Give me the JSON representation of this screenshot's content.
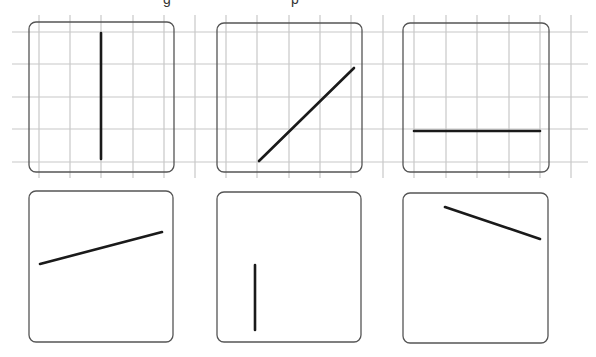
{
  "colors": {
    "background": "#ffffff",
    "grid": "#c8c8c8",
    "frame": "#555555",
    "segment": "#1a1a1a"
  },
  "grid": {
    "h_lines_y": [
      32,
      64,
      97,
      129,
      162
    ],
    "h_line_spans": [
      [
        12,
        200
      ],
      [
        200,
        386
      ],
      [
        386,
        588
      ]
    ],
    "v_lines_x": [
      39,
      70,
      101,
      133,
      164,
      195,
      226,
      257,
      289,
      320,
      351,
      383,
      414,
      446,
      477,
      509,
      540,
      571
    ],
    "v_line_range": [
      15,
      178
    ]
  },
  "panels": [
    {
      "id": "top-1",
      "row": "top",
      "x": 29,
      "y": 22,
      "w": 145,
      "h": 150,
      "gridded": true,
      "segment": {
        "x1": 101,
        "y1": 33,
        "x2": 101,
        "y2": 159,
        "orientation": "vertical"
      }
    },
    {
      "id": "top-2",
      "row": "top",
      "x": 217,
      "y": 23,
      "w": 145,
      "h": 149,
      "gridded": true,
      "segment": {
        "x1": 259,
        "y1": 161,
        "x2": 354,
        "y2": 68,
        "orientation": "diagonal-up"
      }
    },
    {
      "id": "top-3",
      "row": "top",
      "x": 403,
      "y": 23,
      "w": 146,
      "h": 149,
      "gridded": true,
      "segment": {
        "x1": 414,
        "y1": 131,
        "x2": 540,
        "y2": 131,
        "orientation": "horizontal"
      }
    },
    {
      "id": "bottom-1",
      "row": "bottom",
      "x": 29,
      "y": 191,
      "w": 144,
      "h": 151,
      "gridded": false,
      "segment": {
        "x1": 40,
        "y1": 264,
        "x2": 162,
        "y2": 232,
        "orientation": "shallow-up"
      }
    },
    {
      "id": "bottom-2",
      "row": "bottom",
      "x": 217,
      "y": 192,
      "w": 144,
      "h": 150,
      "gridded": false,
      "segment": {
        "x1": 255,
        "y1": 265,
        "x2": 255,
        "y2": 330,
        "orientation": "vertical"
      }
    },
    {
      "id": "bottom-3",
      "row": "bottom",
      "x": 403,
      "y": 193,
      "w": 145,
      "h": 150,
      "gridded": false,
      "segment": {
        "x1": 445,
        "y1": 207,
        "x2": 540,
        "y2": 239,
        "orientation": "shallow-down"
      }
    }
  ],
  "cropped_heading_fragments": [
    {
      "x": 163,
      "glyph": "g"
    },
    {
      "x": 291,
      "glyph": "p"
    }
  ]
}
